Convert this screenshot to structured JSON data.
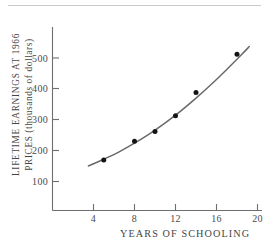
{
  "chart_data": {
    "type": "scatter",
    "title": "",
    "xlabel": "YEARS OF SCHOOLING",
    "ylabel_line1": "LIFETIME EARNINGS AT 1966",
    "ylabel_line2": "PRICES (thousands of dollars)",
    "ylabel": "LIFETIME EARNINGS AT 1966 PRICES (thousands of dollars)",
    "xlim": [
      2,
      21
    ],
    "ylim": [
      0,
      570
    ],
    "xticks": [
      4,
      8,
      12,
      16,
      20
    ],
    "xtick_labels": [
      "4",
      "8",
      "12",
      "16",
      "20"
    ],
    "yticks": [
      100,
      200,
      300,
      400,
      500
    ],
    "ytick_labels": [
      "100",
      "200",
      "300",
      "400",
      "500"
    ],
    "grid": false,
    "legend": "none",
    "points": [
      {
        "x": 5,
        "y": 170
      },
      {
        "x": 8,
        "y": 230
      },
      {
        "x": 10,
        "y": 262
      },
      {
        "x": 12,
        "y": 313
      },
      {
        "x": 14,
        "y": 388
      },
      {
        "x": 18,
        "y": 512
      }
    ],
    "series": [
      {
        "name": "observed earnings",
        "marker": "filled-circle",
        "x": [
          5,
          8,
          10,
          12,
          14,
          18
        ],
        "values": [
          170,
          230,
          262,
          313,
          388,
          512
        ]
      },
      {
        "name": "fitted curve",
        "type": "line",
        "x": [
          3.5,
          5,
          6.5,
          8,
          9.5,
          11,
          12.5,
          14,
          15.5,
          17,
          18.5,
          19.2
        ],
        "values": [
          150,
          172,
          196,
          224,
          255,
          290,
          328,
          370,
          415,
          463,
          513,
          537
        ]
      }
    ],
    "colors": {
      "axis": "#6e6e6e",
      "curve": "#6a6a6a",
      "marker": "#141414",
      "text": "#454545",
      "background": "#ffffff",
      "rule": "#c9c9c9"
    }
  }
}
